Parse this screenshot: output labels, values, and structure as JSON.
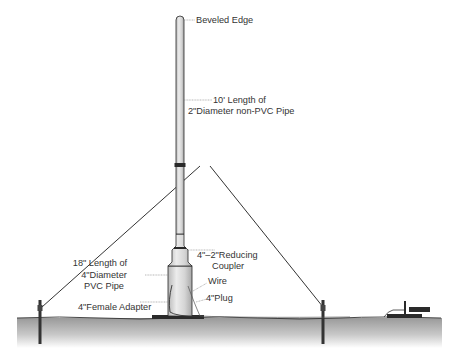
{
  "diagram": {
    "type": "antenna-installation-illustration",
    "labels": {
      "beveled_edge": "Beveled Edge",
      "pipe_length_line1": "10' Length of",
      "pipe_length_line2": "2\"Diameter non-PVC Pipe",
      "reducing_coupler_line1": "4\"–2\"Reducing",
      "reducing_coupler_line2": "Coupler",
      "pvc_line1": "18\" Length of",
      "pvc_line2": "4\"Diameter",
      "pvc_line3": "PVC Pipe",
      "wire": "Wire",
      "plug": "4\"Plug",
      "female_adapter": "4\"Female Adapter"
    },
    "colors": {
      "pipe_fill": "#d9d9d9",
      "pipe_stroke": "#2a2a2a",
      "ground_top": "#9a9a9a",
      "ground_bottom": "#ffffff",
      "guy_wire": "#333333",
      "leader_line": "#888888",
      "label_text": "#333333"
    }
  }
}
